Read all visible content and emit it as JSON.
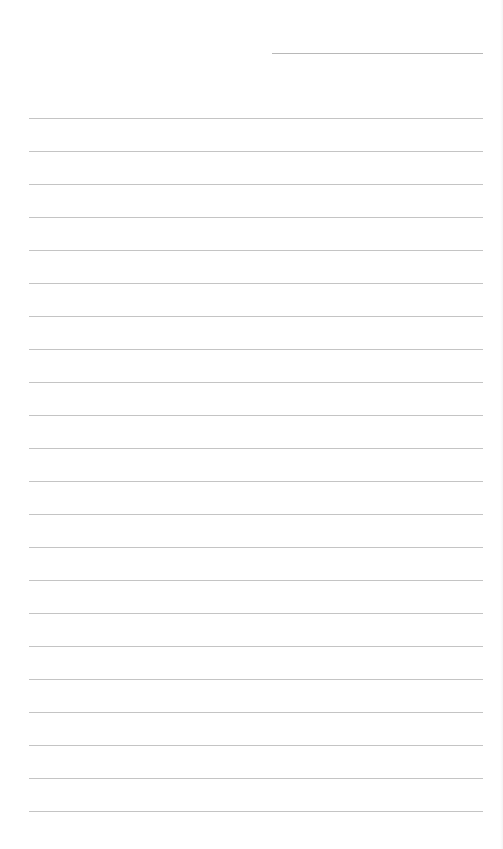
{
  "document": {
    "type": "lined-paper",
    "header_line": {
      "x": 272,
      "y": 53,
      "width": 211
    },
    "rules": {
      "count": 22,
      "start_y": 118,
      "spacing": 33,
      "x": 29,
      "width": 454
    },
    "colors": {
      "background": "#ffffff",
      "rule": "#c4c4c4",
      "header_line": "#b8b8b8"
    }
  }
}
